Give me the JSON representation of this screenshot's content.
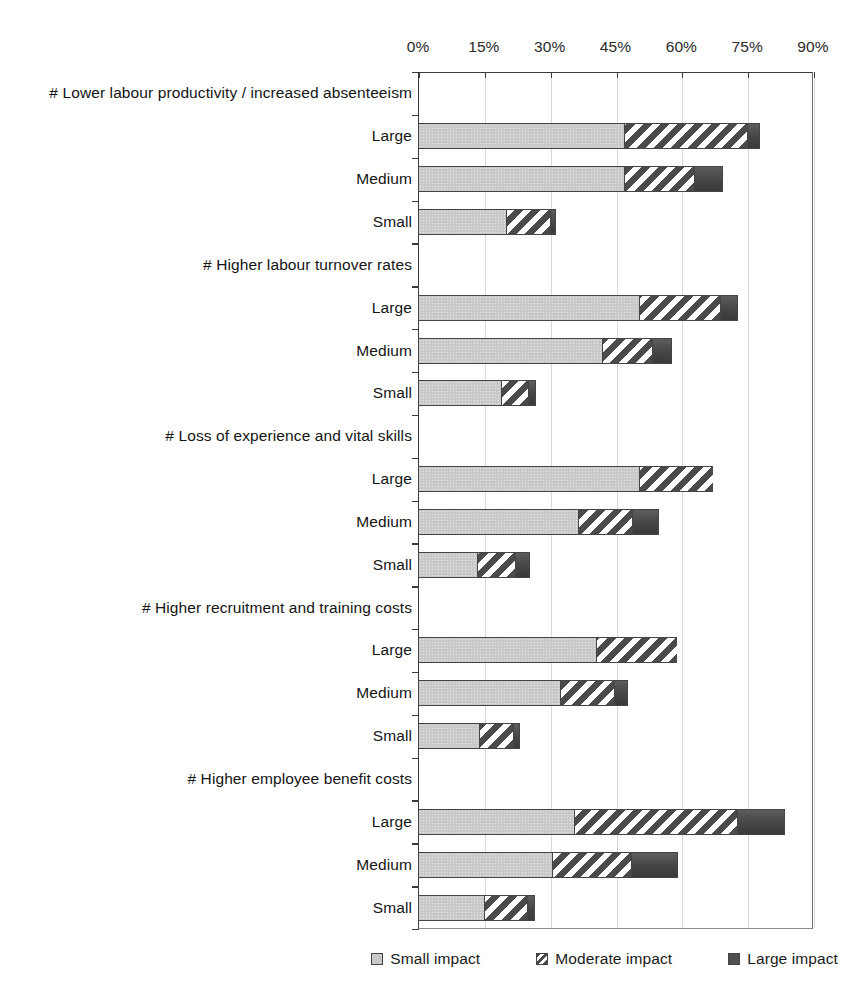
{
  "chart_data": {
    "type": "bar",
    "orientation": "horizontal",
    "stacked": true,
    "title": "",
    "subtitle": "",
    "xlabel": "",
    "ylabel": "",
    "xlim": [
      0,
      90
    ],
    "xtick_labels": [
      "0%",
      "15%",
      "30%",
      "45%",
      "60%",
      "75%",
      "90%"
    ],
    "xticks": [
      0,
      15,
      30,
      45,
      60,
      75,
      90
    ],
    "grid": true,
    "legend_position": "bottom-right",
    "legend": [
      {
        "name": "Small impact",
        "swatch": "small-impact",
        "color": "#c9c9c9"
      },
      {
        "name": "Moderate impact",
        "swatch": "moderate-impact",
        "color": "#4a4a4a"
      },
      {
        "name": "Large impact",
        "swatch": "large-impact",
        "color": "#4f4f4f"
      }
    ],
    "series": [
      {
        "name": "Small impact",
        "key": "small"
      },
      {
        "name": "Moderate impact",
        "key": "moderate"
      },
      {
        "name": "Large impact",
        "key": "large"
      }
    ],
    "groups": [
      {
        "header": "#  Lower labour productivity / increased absenteeism",
        "rows": [
          {
            "label": "Large",
            "small": 47.0,
            "moderate": 28.0,
            "large": 3.0,
            "total": 78.0
          },
          {
            "label": "Medium",
            "small": 47.0,
            "moderate": 16.0,
            "large": 6.5,
            "total": 69.5
          },
          {
            "label": "Small",
            "small": 20.0,
            "moderate": 10.0,
            "large": 1.4,
            "total": 31.4
          }
        ]
      },
      {
        "header": "#  Higher labour turnover rates",
        "rows": [
          {
            "label": "Large",
            "small": 50.3,
            "moderate": 18.5,
            "large": 4.1,
            "total": 72.9
          },
          {
            "label": "Medium",
            "small": 42.0,
            "moderate": 11.3,
            "large": 4.5,
            "total": 57.8
          },
          {
            "label": "Small",
            "small": 19.0,
            "moderate": 6.0,
            "large": 1.9,
            "total": 26.9
          }
        ]
      },
      {
        "header": "#  Loss of experience and vital skills",
        "rows": [
          {
            "label": "Large",
            "small": 50.3,
            "moderate": 16.9,
            "large": 0.0,
            "total": 67.2
          },
          {
            "label": "Medium",
            "small": 36.4,
            "moderate": 12.3,
            "large": 6.3,
            "total": 55.0
          },
          {
            "label": "Small",
            "small": 13.4,
            "moderate": 8.6,
            "large": 3.5,
            "total": 25.5
          }
        ]
      },
      {
        "header": "#  Higher recruitment and training costs",
        "rows": [
          {
            "label": "Large",
            "small": 40.5,
            "moderate": 18.5,
            "large": 0.0,
            "total": 59.0
          },
          {
            "label": "Medium",
            "small": 32.3,
            "moderate": 12.3,
            "large": 3.2,
            "total": 47.8
          },
          {
            "label": "Small",
            "small": 13.9,
            "moderate": 7.7,
            "large": 1.6,
            "total": 23.2
          }
        ]
      },
      {
        "header": "#  Higher employee benefit costs",
        "rows": [
          {
            "label": "Large",
            "small": 35.5,
            "moderate": 37.2,
            "large": 10.9,
            "total": 83.6
          },
          {
            "label": "Medium",
            "small": 30.5,
            "moderate": 18.0,
            "large": 10.7,
            "total": 59.2
          },
          {
            "label": "Small",
            "small": 15.0,
            "moderate": 9.8,
            "large": 1.8,
            "total": 26.6
          }
        ]
      }
    ]
  }
}
